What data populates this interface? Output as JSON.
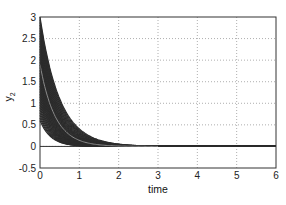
{
  "chart_data": {
    "type": "line",
    "title": "",
    "xlabel": "time",
    "ylabel": "y_2",
    "xlim": [
      0,
      6
    ],
    "ylim": [
      -0.5,
      3
    ],
    "xticks": [
      0,
      1,
      2,
      3,
      4,
      5,
      6
    ],
    "yticks": [
      -0.5,
      0,
      0.5,
      1,
      1.5,
      2,
      2.5,
      3
    ],
    "xtick_labels": [
      "0",
      "1",
      "2",
      "3",
      "4",
      "5",
      "6"
    ],
    "ytick_labels": [
      "-0.5",
      "0",
      "0.5",
      "1",
      "1.5",
      "2",
      "2.5",
      "3"
    ],
    "grid": true,
    "grid_style": "dotted",
    "legend": null,
    "series_envelope": {
      "upper": {
        "x": [
          0,
          0.25,
          0.5,
          0.75,
          1.0,
          1.25,
          1.5,
          1.75,
          2.0,
          2.5,
          6
        ],
        "y": [
          3.0,
          1.9,
          1.2,
          0.75,
          0.45,
          0.26,
          0.14,
          0.07,
          0.03,
          0.0,
          0.0
        ]
      },
      "lower": {
        "x": [
          0,
          0.25,
          0.5,
          0.75,
          1.0,
          1.25,
          1.5,
          2.0,
          6
        ],
        "y": [
          0.6,
          0.25,
          0.1,
          0.04,
          0.015,
          0.005,
          0.0,
          0.0,
          0.0
        ]
      },
      "highlight_curve": {
        "x": [
          0,
          0.25,
          0.5,
          0.75,
          1.0,
          1.5,
          2.0,
          6
        ],
        "y": [
          1.9,
          1.1,
          0.6,
          0.32,
          0.17,
          0.05,
          0.01,
          0.0
        ]
      }
    },
    "colors": {
      "band": "#2b2b2b",
      "highlight": "#8a8a8a",
      "grid": "#9a9a9a",
      "axis": "#333333"
    }
  }
}
